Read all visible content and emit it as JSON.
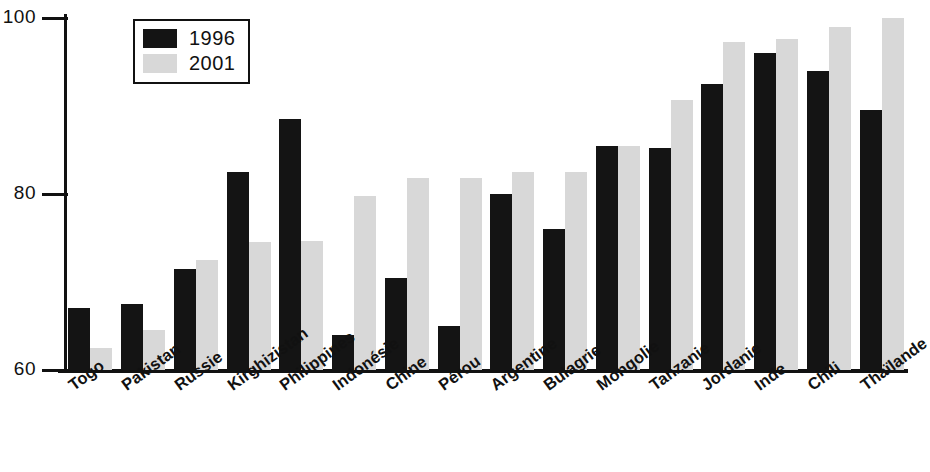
{
  "chart_data": {
    "type": "bar",
    "title": "",
    "subtitle": "",
    "xlabel": "",
    "ylabel": "",
    "ylim": [
      60,
      100
    ],
    "yticks": [
      60,
      80,
      100
    ],
    "ytick_labels": [
      "60",
      "80",
      "100"
    ],
    "grid": false,
    "legend_position": "top-left",
    "categories": [
      "Togo",
      "Pakistan",
      "Russie",
      "Kirghizistan",
      "Philippines",
      "Indonésie",
      "Chine",
      "Pérou",
      "Argentine",
      "Bulagrie",
      "Mongolie",
      "Tanzanie",
      "Jordanie",
      "Inde",
      "Chili",
      "Thaïlande"
    ],
    "series": [
      {
        "name": "1996",
        "color": "#141414",
        "values": [
          67,
          67.5,
          71.5,
          82.5,
          88.5,
          64,
          70.5,
          65,
          80,
          76,
          85.5,
          85.2,
          92.5,
          96,
          94,
          89.5
        ]
      },
      {
        "name": "2001",
        "color": "#d8d8d8",
        "values": [
          62.5,
          64.5,
          72.5,
          74.5,
          74.7,
          79.8,
          81.8,
          81.8,
          82.5,
          82.5,
          85.5,
          90.7,
          97.3,
          97.6,
          99,
          100
        ]
      }
    ]
  },
  "legend": {
    "entries": [
      {
        "label": "1996",
        "swatch": "legend-swatch-1996"
      },
      {
        "label": "2001",
        "swatch": "legend-swatch-2001"
      }
    ]
  },
  "axis": {
    "y_top_label": "100",
    "y_mid_label": "80",
    "y_bottom_label": "60"
  }
}
